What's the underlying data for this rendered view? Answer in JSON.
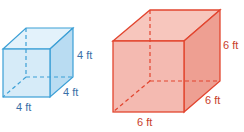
{
  "figure": {
    "small_cube": {
      "color_fill": "#cfe8f7",
      "color_stroke": "#3b9fd6",
      "label_color": "#3a6fa8",
      "height_label": "4 ft",
      "depth_label": "4 ft",
      "width_label": "4 ft"
    },
    "large_cube": {
      "color_fill": "#f3b3a8",
      "color_stroke": "#e2452f",
      "label_color": "#c8402b",
      "height_label": "6 ft",
      "depth_label": "6 ft",
      "width_label": "6 ft"
    }
  }
}
